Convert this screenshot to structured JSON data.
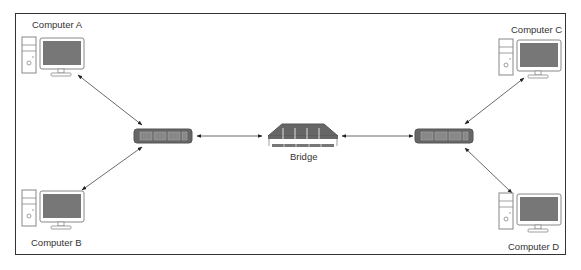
{
  "diagram": {
    "title": "",
    "nodes": [
      {
        "id": "computer-a",
        "label": "Computer A",
        "type": "computer"
      },
      {
        "id": "computer-b",
        "label": "Computer B",
        "type": "computer"
      },
      {
        "id": "computer-c",
        "label": "Computer C",
        "type": "computer"
      },
      {
        "id": "computer-d",
        "label": "Computer D",
        "type": "computer"
      },
      {
        "id": "switch-left",
        "label": "",
        "type": "switch"
      },
      {
        "id": "bridge",
        "label": "Bridge",
        "type": "bridge"
      },
      {
        "id": "switch-right",
        "label": "",
        "type": "switch"
      }
    ],
    "edges": [
      {
        "from": "computer-a",
        "to": "switch-left",
        "bidirectional": true
      },
      {
        "from": "computer-b",
        "to": "switch-left",
        "bidirectional": true
      },
      {
        "from": "switch-left",
        "to": "bridge",
        "bidirectional": true
      },
      {
        "from": "bridge",
        "to": "switch-right",
        "bidirectional": true
      },
      {
        "from": "computer-c",
        "to": "switch-right",
        "bidirectional": true
      },
      {
        "from": "computer-d",
        "to": "switch-right",
        "bidirectional": true
      }
    ]
  },
  "labels": {
    "computer_a": "Computer A",
    "computer_b": "Computer B",
    "computer_c": "Computer C",
    "computer_d": "Computer D",
    "bridge": "Bridge"
  },
  "colors": {
    "device_fill": "#666666",
    "screen_fill": "#7a7a7a",
    "line": "#333333"
  }
}
